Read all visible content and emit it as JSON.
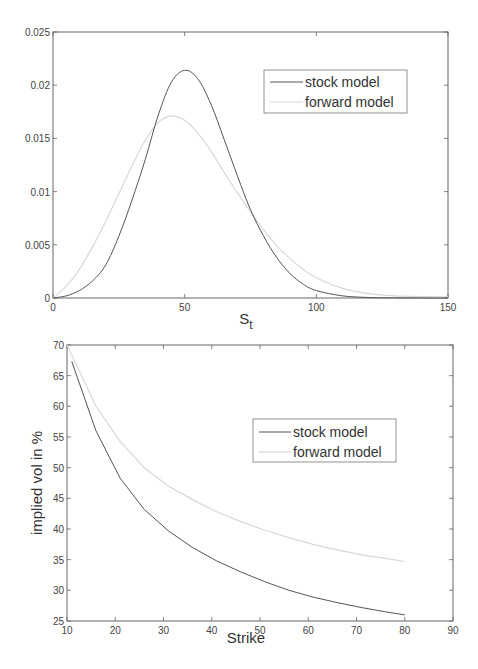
{
  "colors": {
    "stock": "#555555",
    "forward": "#d8d8d8",
    "axis": "#666666",
    "background": "#ffffff"
  },
  "chart_data": [
    {
      "type": "line",
      "title": "",
      "xlabel": "S",
      "xlabel_subscript": "t",
      "ylabel": "",
      "xlim": [
        0,
        150
      ],
      "ylim": [
        0,
        0.025
      ],
      "xticks": [
        0,
        50,
        100,
        150
      ],
      "xtick_labels": [
        "0",
        "50",
        "100",
        "150"
      ],
      "yticks": [
        0,
        0.005,
        0.01,
        0.015,
        0.02,
        0.025
      ],
      "ytick_labels": [
        "0",
        "0.005",
        "0.01",
        "0.015",
        "0.02",
        "0.025"
      ],
      "grid": false,
      "legend_position": "upper right",
      "series": [
        {
          "name": "stock model",
          "x": [
            0,
            5,
            10,
            15,
            20,
            25,
            30,
            35,
            40,
            45,
            50,
            55,
            60,
            65,
            70,
            75,
            80,
            85,
            90,
            95,
            100,
            110,
            120,
            130,
            150
          ],
          "values": [
            0,
            0.0002,
            0.0007,
            0.0016,
            0.0031,
            0.0058,
            0.0092,
            0.013,
            0.0172,
            0.0203,
            0.0214,
            0.0206,
            0.0182,
            0.0149,
            0.0115,
            0.0083,
            0.0058,
            0.0038,
            0.0023,
            0.0013,
            0.0007,
            0.0002,
            5e-05,
            1e-05,
            0
          ]
        },
        {
          "name": "forward model",
          "x": [
            0,
            5,
            10,
            15,
            20,
            25,
            30,
            35,
            40,
            45,
            50,
            55,
            60,
            65,
            70,
            75,
            80,
            85,
            90,
            95,
            100,
            110,
            120,
            130,
            150
          ],
          "values": [
            0,
            0.0011,
            0.0027,
            0.0048,
            0.0072,
            0.0098,
            0.0124,
            0.0148,
            0.0165,
            0.0171,
            0.0167,
            0.0155,
            0.0138,
            0.0118,
            0.0099,
            0.0081,
            0.0064,
            0.0049,
            0.0037,
            0.0027,
            0.0019,
            0.0009,
            0.0004,
            0.0002,
            0.0001
          ]
        }
      ]
    },
    {
      "type": "line",
      "title": "",
      "xlabel": "Strike",
      "ylabel": "implied vol in %",
      "xlim": [
        10,
        90
      ],
      "ylim": [
        25,
        70
      ],
      "xticks": [
        10,
        20,
        30,
        40,
        50,
        60,
        70,
        80,
        90
      ],
      "xtick_labels": [
        "10",
        "20",
        "30",
        "40",
        "50",
        "60",
        "70",
        "80",
        "90"
      ],
      "yticks": [
        25,
        30,
        35,
        40,
        45,
        50,
        55,
        60,
        65,
        70
      ],
      "ytick_labels": [
        "25",
        "30",
        "35",
        "40",
        "45",
        "50",
        "55",
        "60",
        "65",
        "70"
      ],
      "grid": false,
      "legend_position": "center right",
      "series": [
        {
          "name": "stock model",
          "x": [
            11,
            16,
            21,
            26,
            31,
            36,
            41,
            46,
            51,
            56,
            61,
            66,
            71,
            76,
            80
          ],
          "values": [
            67.3,
            56.0,
            48.3,
            43.2,
            39.7,
            37.0,
            34.8,
            33.0,
            31.4,
            30.0,
            28.9,
            28.0,
            27.2,
            26.5,
            26.0
          ]
        },
        {
          "name": "forward model",
          "x": [
            10,
            16,
            21,
            26,
            31,
            36,
            41,
            46,
            51,
            56,
            61,
            66,
            71,
            76,
            80
          ],
          "values": [
            70.0,
            60.0,
            54.3,
            50.0,
            47.0,
            44.8,
            42.8,
            41.2,
            39.8,
            38.6,
            37.5,
            36.6,
            35.8,
            35.2,
            34.7
          ]
        }
      ]
    }
  ]
}
